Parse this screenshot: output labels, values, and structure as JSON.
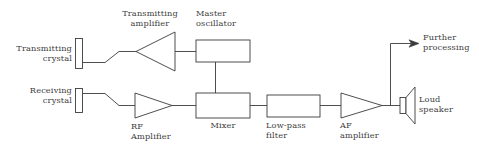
{
  "diagram": {
    "stroke_color": "#3b3b3b",
    "text_color": "#3d3d3d",
    "background_color": "#ffffff",
    "labels": {
      "transmitting_crystal": "Transmitting\ncrystal",
      "transmitting_amplifier": "Transmitting\namplifier",
      "master_oscillator": "Master\noscillator",
      "receiving_crystal": "Receiving\ncrystal",
      "rf_amplifier": "RF\nAmplifier",
      "mixer": "Mixer",
      "low_pass_filter": "Low-pass\nfilter",
      "af_amplifier": "AF\namplifier",
      "loud_speaker": "Loud\nspeaker",
      "further_processing": "Further\nprocessing"
    },
    "blocks": [
      {
        "id": "transmitting-crystal",
        "kind": "crystal",
        "label": "Transmitting crystal"
      },
      {
        "id": "transmitting-amplifier",
        "kind": "amplifier-left",
        "label": "Transmitting amplifier"
      },
      {
        "id": "master-oscillator",
        "kind": "box",
        "label": "Master oscillator"
      },
      {
        "id": "receiving-crystal",
        "kind": "crystal",
        "label": "Receiving crystal"
      },
      {
        "id": "rf-amplifier",
        "kind": "amplifier-right",
        "label": "RF Amplifier"
      },
      {
        "id": "mixer",
        "kind": "box",
        "label": "Mixer"
      },
      {
        "id": "low-pass-filter",
        "kind": "box",
        "label": "Low-pass filter"
      },
      {
        "id": "af-amplifier",
        "kind": "amplifier-right",
        "label": "AF amplifier"
      },
      {
        "id": "loud-speaker",
        "kind": "speaker",
        "label": "Loud speaker"
      },
      {
        "id": "further-processing",
        "kind": "output-arrow",
        "label": "Further processing"
      }
    ]
  }
}
